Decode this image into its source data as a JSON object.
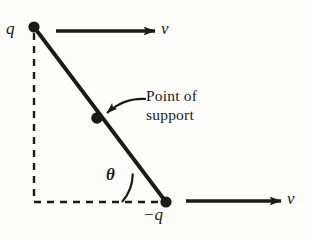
{
  "figure": {
    "background_color": "#fdfdfb",
    "ink_color": "#1a1a18",
    "labels": {
      "charge_top": "q",
      "charge_bottom": "−q",
      "velocity_top": "v",
      "velocity_bottom": "v",
      "angle": "θ",
      "support_line1": "Point of",
      "support_line2": "support"
    },
    "geometry": {
      "top_charge_point": [
        34,
        27
      ],
      "support_point": [
        97,
        118
      ],
      "bottom_charge_point": [
        166,
        202
      ],
      "dot_radius": 5.5,
      "rod_stroke_width": 3.6,
      "dashed_vertical": {
        "x": 34,
        "y_top": 32,
        "y_bottom": 202
      },
      "dashed_horizontal": {
        "y": 202,
        "x_left": 34,
        "x_right": 166
      },
      "angle_arc_radius": 44,
      "arrow_top": {
        "x_start": 56,
        "x_end": 156,
        "y": 31
      },
      "arrow_bottom": {
        "x_start": 186,
        "x_end": 282,
        "y": 201
      },
      "pointer_curve": {
        "x_start": 146,
        "y_start": 99,
        "x_end": 106,
        "y_end": 114
      }
    }
  }
}
